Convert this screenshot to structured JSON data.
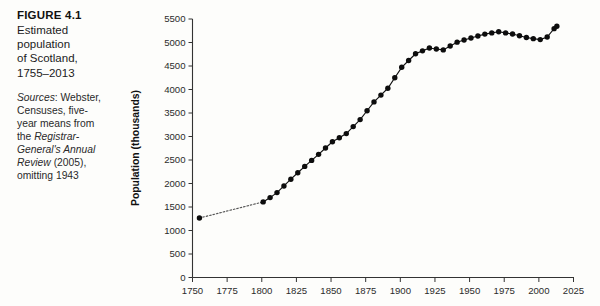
{
  "caption": {
    "figure_number": "FIGURE 4.1",
    "title_lines": [
      "Estimated",
      "population",
      "of Scotland,",
      "1755–2013"
    ],
    "sources_label": "Sources",
    "sources_text_1": ": Webster, Censuses, five-year means from the ",
    "sources_italic_1": "Registrar-General's Annual Review",
    "sources_text_2": " (2005), omitting 1943"
  },
  "chart_data": {
    "type": "line",
    "title": "Estimated population of Scotland, 1755–2013",
    "xlabel": "",
    "ylabel": "Population (thousands)",
    "xlim": [
      1750,
      2025
    ],
    "ylim": [
      0,
      5500
    ],
    "xticks": [
      1750,
      1775,
      1800,
      1825,
      1850,
      1875,
      1900,
      1925,
      1950,
      1975,
      2000,
      2025
    ],
    "yticks": [
      0,
      500,
      1000,
      1500,
      2000,
      2500,
      3000,
      3500,
      4000,
      4500,
      5000,
      5500
    ],
    "grid": false,
    "legend": null,
    "marker": "filled-circle",
    "series": [
      {
        "name": "Estimated population of Scotland",
        "segment_style_first": "dotted",
        "x": [
          1755,
          1801,
          1811,
          1821,
          1831,
          1841,
          1851,
          1861,
          1871,
          1881,
          1891,
          1901,
          1911,
          1921,
          1931,
          1939,
          1951,
          1961,
          1971,
          1981,
          1991,
          2001,
          2011,
          2013
        ],
        "values": [
          1265,
          1608,
          1806,
          2092,
          2364,
          2620,
          2889,
          3062,
          3360,
          3736,
          4026,
          4472,
          4761,
          4882,
          4843,
          5007,
          5096,
          5179,
          5229,
          5180,
          5107,
          5062,
          5295,
          5345
        ]
      }
    ],
    "intermediate_points_note": "five-year means plotted between census years",
    "dense_x": [
      1755,
      1801,
      1806,
      1811,
      1816,
      1821,
      1826,
      1831,
      1836,
      1841,
      1846,
      1851,
      1856,
      1861,
      1866,
      1871,
      1876,
      1881,
      1886,
      1891,
      1896,
      1901,
      1906,
      1911,
      1916,
      1921,
      1926,
      1931,
      1936,
      1941,
      1946,
      1951,
      1956,
      1961,
      1966,
      1971,
      1976,
      1981,
      1986,
      1991,
      1996,
      2001,
      2006,
      2011,
      2013
    ],
    "dense_values": [
      1265,
      1608,
      1700,
      1806,
      1948,
      2092,
      2228,
      2364,
      2492,
      2620,
      2755,
      2889,
      2975,
      3062,
      3211,
      3360,
      3548,
      3736,
      3881,
      4026,
      4249,
      4472,
      4617,
      4761,
      4822,
      4882,
      4862,
      4843,
      4925,
      5007,
      5052,
      5096,
      5138,
      5179,
      5204,
      5229,
      5204,
      5180,
      5144,
      5107,
      5082,
      5062,
      5117,
      5295,
      5345
    ]
  }
}
